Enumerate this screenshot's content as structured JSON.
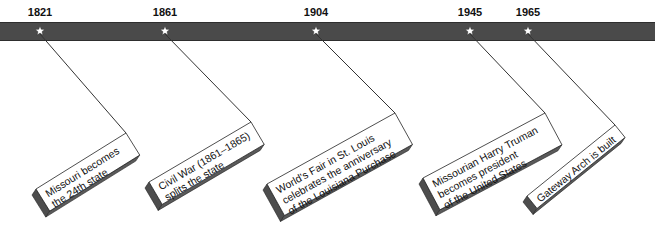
{
  "colors": {
    "bar": "#4a4a4a",
    "bar_border": "#2e2e2e",
    "star": "#ffffff",
    "card_face": "#ffffff",
    "card_shadow": "#4d4d4d",
    "card_outline": "#222222",
    "leader": "#333333",
    "text": "#111111"
  },
  "events": [
    {
      "year": "1821",
      "lines": [
        "Missouri becomes",
        "the 24th state"
      ],
      "star_x": 40,
      "left": [
        36,
        189
      ],
      "top": [
        126,
        133
      ]
    },
    {
      "year": "1861",
      "lines": [
        "Civil War (1861–1865)",
        "splits the state"
      ],
      "star_x": 165,
      "left": [
        149,
        182
      ],
      "top": [
        251,
        122
      ]
    },
    {
      "year": "1904",
      "lines": [
        "World's Fair in St. Louis",
        "celebrates the anniversary",
        "of the Louisiana Purchase"
      ],
      "star_x": 316,
      "left": [
        267,
        184
      ],
      "top": [
        395,
        113
      ]
    },
    {
      "year": "1945",
      "lines": [
        "Missourian Harry Truman",
        "becomes president",
        "of the United States"
      ],
      "star_x": 470,
      "left": [
        423,
        178
      ],
      "top": [
        545,
        113
      ]
    },
    {
      "year": "1965",
      "lines": [
        "Gateway Arch is built"
      ],
      "star_x": 528,
      "left": [
        527,
        196
      ],
      "top": [
        615,
        125
      ]
    }
  ]
}
